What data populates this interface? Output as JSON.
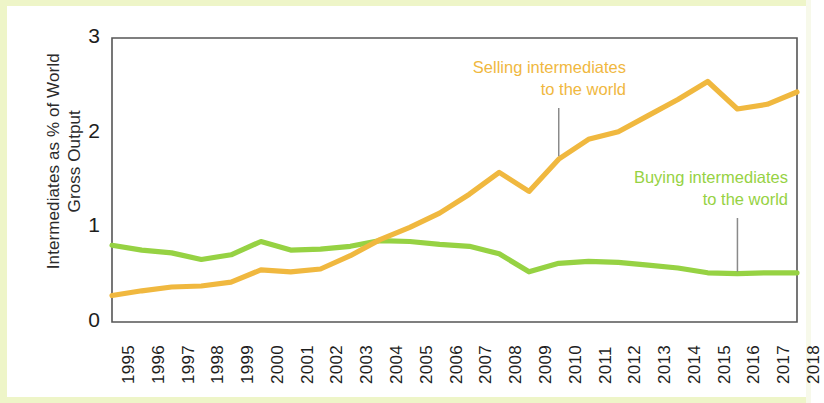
{
  "axes": {
    "y_title_line1": "Intermediates as % of World",
    "y_title_line2": "Gross Output",
    "y_ticks": [
      "0",
      "1",
      "2",
      "3"
    ]
  },
  "annotations": {
    "selling": "Selling intermediates\nto the world",
    "buying": "Buying intermediates\nto the world"
  },
  "colors": {
    "selling": "#f0b83f",
    "buying": "#96d243",
    "axis": "#555555",
    "border": "#eef5c8",
    "leader": "#8a8a8a"
  },
  "chart_data": {
    "type": "line",
    "title": "",
    "xlabel": "",
    "ylabel": "Intermediates as % of World Gross Output",
    "ylim": [
      0,
      3
    ],
    "yticks": [
      0,
      1,
      2,
      3
    ],
    "grid": false,
    "legend": "annotated-inline",
    "categories": [
      "1995",
      "1996",
      "1997",
      "1998",
      "1999",
      "2000",
      "2001",
      "2002",
      "2003",
      "2004",
      "2005",
      "2006",
      "2007",
      "2008",
      "2009",
      "2010",
      "2011",
      "2012",
      "2013",
      "2014",
      "2015",
      "2016",
      "2017",
      "2018"
    ],
    "series": [
      {
        "name": "Selling intermediates to the world",
        "color": "#f0b83f",
        "values": [
          0.28,
          0.33,
          0.37,
          0.38,
          0.42,
          0.55,
          0.53,
          0.56,
          0.7,
          0.87,
          1.0,
          1.15,
          1.35,
          1.58,
          1.38,
          1.72,
          1.93,
          2.01,
          2.18,
          2.35,
          2.54,
          2.25,
          2.3,
          2.43
        ]
      },
      {
        "name": "Buying intermediates to the world",
        "color": "#96d243",
        "values": [
          0.81,
          0.76,
          0.73,
          0.66,
          0.71,
          0.85,
          0.76,
          0.77,
          0.8,
          0.86,
          0.85,
          0.82,
          0.8,
          0.72,
          0.53,
          0.62,
          0.64,
          0.63,
          0.6,
          0.57,
          0.52,
          0.51,
          0.52,
          0.52
        ]
      }
    ],
    "annotations": [
      {
        "text": "Selling intermediates to the world",
        "series": "Selling intermediates to the world",
        "anchor_year": "2010",
        "color": "#f0b83f"
      },
      {
        "text": "Buying intermediates to the world",
        "series": "Buying intermediates to the world",
        "anchor_year": "2016",
        "color": "#96d243"
      }
    ]
  }
}
